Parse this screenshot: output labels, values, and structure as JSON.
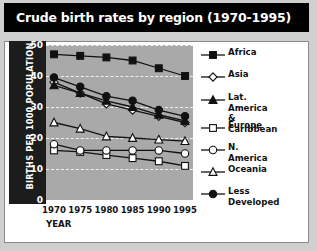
{
  "title": "Crude birth rates by region (1970-1995)",
  "axes": {
    "ylabel": "BIRTHS PER 1000 POPULATION",
    "xlabel": "YEAR",
    "yticks": [
      "0",
      "10",
      "20",
      "30",
      "40",
      "50"
    ],
    "xticks": [
      "1970",
      "1975",
      "1980",
      "1985",
      "1990",
      "1995"
    ]
  },
  "colors": {
    "title_bar": "#000000",
    "title_text": "#ffffff",
    "plot_bg": "#a9a9a9",
    "plate_bg": "#ffffff",
    "axis_band": "#1c1c1c",
    "grid": "#f0f0f0",
    "line": "#111111"
  },
  "legend": [
    {
      "label": "Africa",
      "marker": "filled-square"
    },
    {
      "label": "Asia",
      "marker": "open-diamond"
    },
    {
      "label": "Lat. America\n& Caribbean",
      "marker": "filled-triangle"
    },
    {
      "label": "Europe",
      "marker": "open-square"
    },
    {
      "label": "N. America",
      "marker": "open-circle"
    },
    {
      "label": "Oceania",
      "marker": "open-triangle"
    },
    {
      "label": "Less\nDeveloped",
      "marker": "filled-circle"
    }
  ],
  "chart_data": {
    "type": "line",
    "title": "Crude birth rates by region (1970-1995)",
    "xlabel": "YEAR",
    "ylabel": "BIRTHS PER 1000 POPULATION",
    "x": [
      1970,
      1975,
      1980,
      1985,
      1990,
      1995
    ],
    "xlim": [
      1970,
      1995
    ],
    "ylim": [
      0,
      50
    ],
    "yticks": [
      0,
      10,
      20,
      30,
      40,
      50
    ],
    "grid": "horizontal-dashed",
    "legend_position": "right",
    "series": [
      {
        "name": "Africa",
        "marker": "filled-square",
        "values": [
          47,
          46.5,
          46,
          45,
          42.5,
          40
        ]
      },
      {
        "name": "Asia",
        "marker": "open-diamond",
        "values": [
          38,
          34.5,
          31,
          29,
          27,
          25
        ]
      },
      {
        "name": "Lat. America & Caribbean",
        "marker": "filled-triangle",
        "values": [
          37,
          34.5,
          32,
          30,
          27.5,
          25.5
        ]
      },
      {
        "name": "Europe",
        "marker": "open-square",
        "values": [
          16,
          15.5,
          14.5,
          13.5,
          12.5,
          11
        ]
      },
      {
        "name": "N. America",
        "marker": "open-circle",
        "values": [
          18,
          16,
          16,
          16,
          16,
          15
        ]
      },
      {
        "name": "Oceania",
        "marker": "open-triangle",
        "values": [
          25,
          23,
          20.5,
          20,
          19.5,
          19
        ]
      },
      {
        "name": "Less Developed",
        "marker": "filled-circle",
        "values": [
          39.5,
          36.5,
          33.5,
          32,
          29,
          27
        ]
      }
    ]
  }
}
